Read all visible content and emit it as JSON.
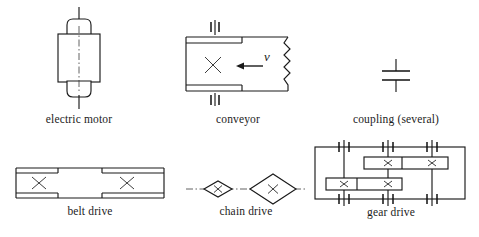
{
  "diagram": {
    "background_color": "#ffffff",
    "line_color": "#1a1a1a",
    "symbols": [
      {
        "id": "electric-motor",
        "label": "electric motor",
        "description": "vertical rotor body with two bearing caps and through shaft on a dash-dot centerline"
      },
      {
        "id": "conveyor",
        "label": "conveyor",
        "description": "belt band with drive pulley cross, two ground bearings and zigzag break at right end",
        "velocity_label": "v",
        "velocity_direction": "left"
      },
      {
        "id": "coupling",
        "label": "coupling (several)",
        "description": "two flange bars on a common vertical shaft"
      },
      {
        "id": "belt-drive",
        "label": "belt drive",
        "description": "belt band spanning two pulleys marked with crosses"
      },
      {
        "id": "chain-drive",
        "label": "chain drive",
        "description": "small and large sprocket diamonds with crosses on a dash-dot shaft line"
      },
      {
        "id": "gear-drive",
        "label": "gear drive",
        "description": "gearbox housing with three shafts, six bearings and two gear pairs marked with crosses"
      }
    ]
  }
}
